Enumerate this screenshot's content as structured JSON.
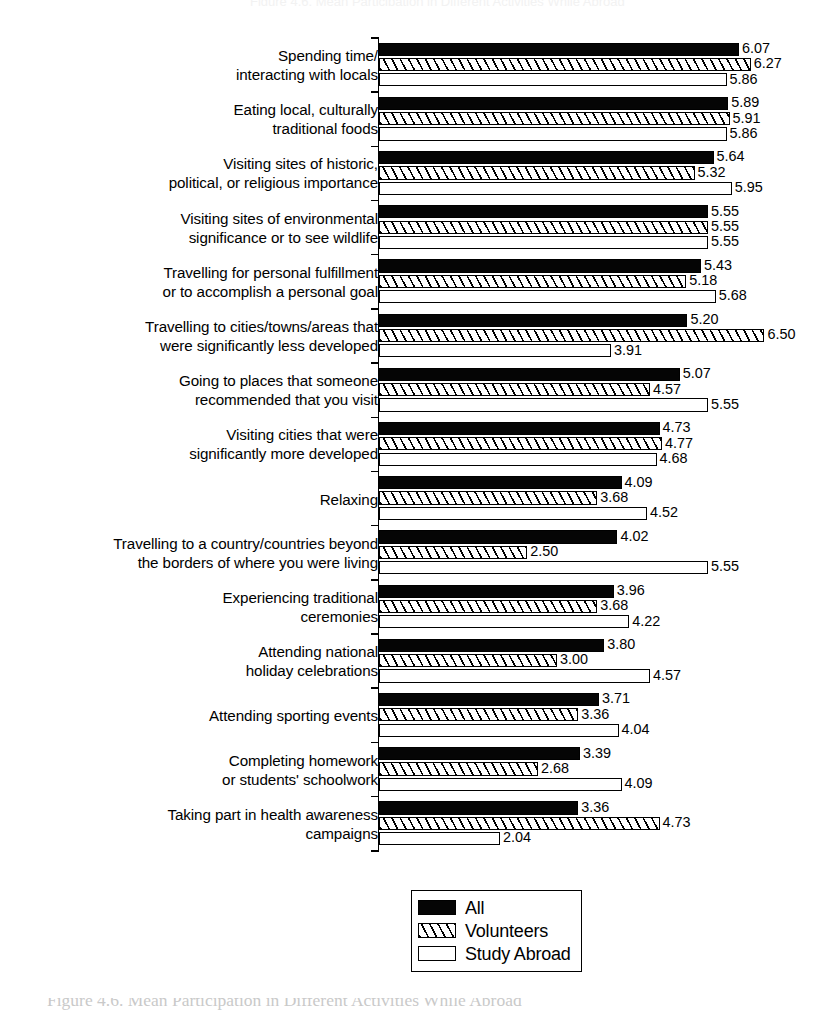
{
  "figure": {
    "top_partial_text": "Figure 4.6. Mean Participation in Different Activities While Abroad",
    "caption": "Figure 4.6. Mean Participation in Different Activities While Abroad"
  },
  "legend": {
    "position": "bottom-center",
    "items": [
      {
        "label": "All",
        "pattern": "solid-black",
        "color": "#050505"
      },
      {
        "label": "Volunteers",
        "pattern": "diagonal-hatch",
        "color": "#ffffff"
      },
      {
        "label": "Study Abroad",
        "pattern": "dotted",
        "color": "#ffffff"
      }
    ]
  },
  "chart_data": {
    "type": "bar",
    "orientation": "horizontal",
    "title": "Figure 4.6. Mean Participation in Different Activities While Abroad",
    "xlabel": "",
    "ylabel": "",
    "xlim": [
      0,
      6.5
    ],
    "grid": false,
    "axis_visible": {
      "x": false,
      "y": true
    },
    "value_labels": true,
    "legend_position": "bottom-center",
    "categories": [
      "Spending time/\ninteracting with locals",
      "Eating local, culturally\ntraditional foods",
      "Visiting sites of historic,\npolitical, or religious importance",
      "Visiting sites of environmental\nsignificance or to see wildlife",
      "Travelling for personal fulfillment\nor to accomplish a personal goal",
      "Travelling to cities/towns/areas that\nwere significantly less developed",
      "Going to places that someone\nrecommended that you visit",
      "Visiting cities that were\nsignificantly more developed",
      "Relaxing",
      "Travelling to a country/countries beyond\nthe borders of where you were living",
      "Experiencing traditional\nceremonies",
      "Attending national\nholiday celebrations",
      "Attending sporting events",
      "Completing homework\nor students' schoolwork",
      "Taking part in health awareness\ncampaigns"
    ],
    "series": [
      {
        "name": "All",
        "values": [
          6.07,
          5.89,
          5.64,
          5.55,
          5.43,
          5.2,
          5.07,
          4.73,
          4.09,
          4.02,
          3.96,
          3.8,
          3.71,
          3.39,
          3.36
        ]
      },
      {
        "name": "Volunteers",
        "values": [
          6.27,
          5.91,
          5.32,
          5.55,
          5.18,
          6.5,
          4.57,
          4.77,
          3.68,
          2.5,
          3.68,
          3.0,
          3.36,
          2.68,
          4.73
        ]
      },
      {
        "name": "Study Abroad",
        "values": [
          5.86,
          5.86,
          5.95,
          5.55,
          5.68,
          3.91,
          5.55,
          4.68,
          4.52,
          5.55,
          4.22,
          4.57,
          4.04,
          4.09,
          2.04
        ]
      }
    ],
    "labels": {
      "All": [
        "6.07",
        "5.89",
        "5.64",
        "5.55",
        "5.43",
        "5.20",
        "5.07",
        "4.73",
        "4.09",
        "4.02",
        "3.96",
        "3.80",
        "3.71",
        "3.39",
        "3.36"
      ],
      "Volunteers": [
        "6.27",
        "5.91",
        "5.32",
        "5.55",
        "5.18",
        "6.50",
        "4.57",
        "4.77",
        "3.68",
        "2.50",
        "3.68",
        "3.00",
        "3.36",
        "2.68",
        "4.73"
      ],
      "Study Abroad": [
        "5.86",
        "5.86",
        "5.95",
        "5.55",
        "5.68",
        "3.91",
        "5.55",
        "4.68",
        "4.52",
        "5.55",
        "4.22",
        "4.57",
        "4.04",
        "4.09",
        "2.04"
      ]
    }
  }
}
